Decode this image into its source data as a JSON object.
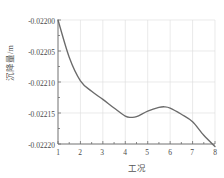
{
  "chart_data": {
    "type": "line",
    "title": "",
    "xlabel": "工况",
    "ylabel": "沉降量/m",
    "xlim": [
      1,
      8
    ],
    "ylim": [
      -0.0222,
      -0.022
    ],
    "grid": true,
    "legend": null,
    "legend_position": "none",
    "line_color": "#6b6b6b",
    "grid_color": "#dcdcdc",
    "axis_color": "#6d6d6d",
    "background_color": "#ffffff",
    "xticks": [
      1,
      2,
      3,
      4,
      5,
      6,
      7,
      8
    ],
    "xtick_labels": [
      "1",
      "2",
      "3",
      "4",
      "5",
      "6",
      "7",
      "8"
    ],
    "yticks": [
      -0.022,
      -0.02205,
      -0.0221,
      -0.02215,
      -0.0222
    ],
    "ytick_labels": [
      "-0.02200",
      "-0.02205",
      "-0.02210",
      "-0.02215",
      "-0.02220"
    ],
    "series": [
      {
        "name": "沉降量",
        "x": [
          1,
          1.5,
          2,
          2.5,
          3,
          3.5,
          4,
          4.25,
          4.5,
          5,
          5.5,
          5.75,
          6,
          6.5,
          7,
          7.5,
          8
        ],
        "values": [
          -0.022,
          -0.02206,
          -0.022098,
          -0.022115,
          -0.022128,
          -0.022142,
          -0.022155,
          -0.022157,
          -0.022156,
          -0.022147,
          -0.022141,
          -0.02214,
          -0.022142,
          -0.022152,
          -0.022164,
          -0.022186,
          -0.022204
        ]
      }
    ],
    "annotations": []
  }
}
